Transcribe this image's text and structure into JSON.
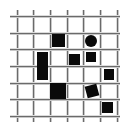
{
  "canvas": {
    "width": 126,
    "height": 134,
    "background": "#ffffff"
  },
  "grid": {
    "line_color": "#6a6a6a",
    "vertical_x": [
      17,
      33,
      50,
      67,
      83,
      100,
      117
    ],
    "horizontal_y": [
      16,
      33,
      49,
      66,
      83,
      99,
      116
    ]
  },
  "shapes": [
    {
      "type": "square",
      "x": 52,
      "y": 34,
      "w": 13,
      "h": 13,
      "rotate": 0
    },
    {
      "type": "circle",
      "x": 85,
      "y": 35,
      "w": 12,
      "h": 12,
      "rotate": 0
    },
    {
      "type": "rect",
      "x": 37,
      "y": 52,
      "w": 11,
      "h": 28,
      "rotate": 0
    },
    {
      "type": "square",
      "x": 69,
      "y": 54,
      "w": 11,
      "h": 11,
      "rotate": 0
    },
    {
      "type": "square",
      "x": 86,
      "y": 52,
      "w": 10,
      "h": 10,
      "rotate": 0
    },
    {
      "type": "square",
      "x": 104,
      "y": 69,
      "w": 10,
      "h": 11,
      "rotate": 0
    },
    {
      "type": "square",
      "x": 50,
      "y": 83,
      "w": 16,
      "h": 16,
      "rotate": 0
    },
    {
      "type": "square",
      "x": 86,
      "y": 85,
      "w": 12,
      "h": 12,
      "rotate": -15
    },
    {
      "type": "square",
      "x": 102,
      "y": 102,
      "w": 11,
      "h": 11,
      "rotate": 0
    }
  ],
  "shape_color": "#0a0a0a"
}
